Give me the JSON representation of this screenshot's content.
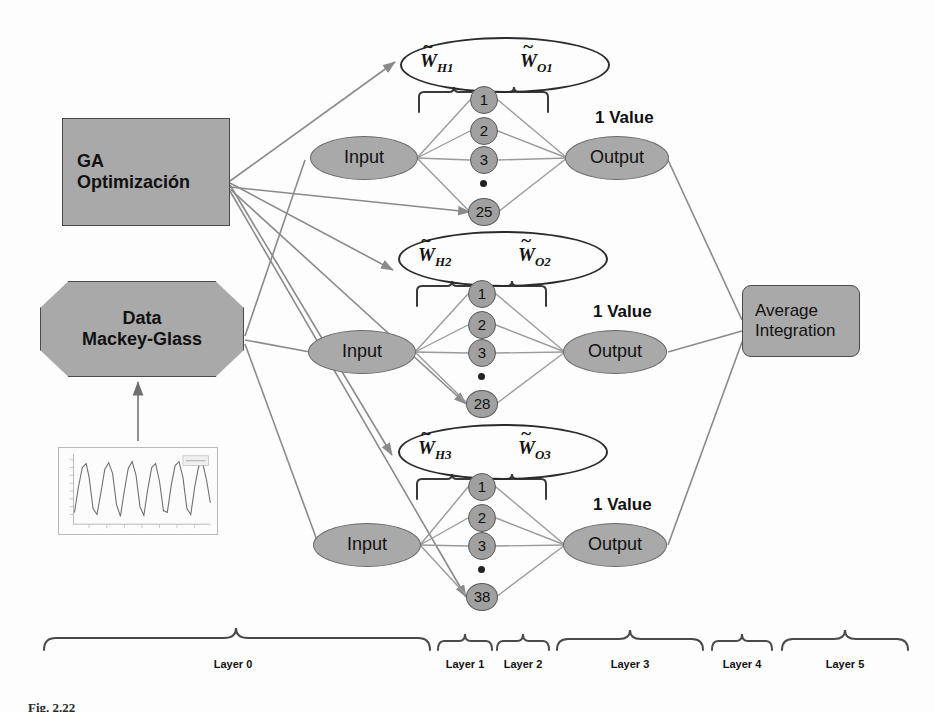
{
  "figure": {
    "caption": "Fig. 2.22"
  },
  "sources": {
    "ga": {
      "line1": "GA",
      "line2": "Optimización"
    },
    "data": {
      "line1": "Data",
      "line2": "Mackey-Glass"
    },
    "thumbnail_name": "mackey-glass-timeseries-plot"
  },
  "aggregator": {
    "line1": "Average",
    "line2": "Integration"
  },
  "modules": [
    {
      "weight_hidden": {
        "base": "W",
        "sub": "H1"
      },
      "weight_output": {
        "base": "W",
        "sub": "O1"
      },
      "input_label": "Input",
      "output_label": "Output",
      "value_label": "1 Value",
      "neurons": [
        "1",
        "2",
        "3",
        "•",
        "25"
      ]
    },
    {
      "weight_hidden": {
        "base": "W",
        "sub": "H2"
      },
      "weight_output": {
        "base": "W",
        "sub": "O2"
      },
      "input_label": "Input",
      "output_label": "Output",
      "value_label": "1 Value",
      "neurons": [
        "1",
        "2",
        "3",
        "•",
        "28"
      ]
    },
    {
      "weight_hidden": {
        "base": "W",
        "sub": "H3"
      },
      "weight_output": {
        "base": "W",
        "sub": "O3"
      },
      "input_label": "Input",
      "output_label": "Output",
      "value_label": "1 Value",
      "neurons": [
        "1",
        "2",
        "3",
        "•",
        "38"
      ]
    }
  ],
  "layers": [
    {
      "label": "Layer 0"
    },
    {
      "label": "Layer 1"
    },
    {
      "label": "Layer 2"
    },
    {
      "label": "Layer 3"
    },
    {
      "label": "Layer 4"
    },
    {
      "label": "Layer 5"
    }
  ],
  "colors": {
    "fill_gray": "#a9a9a9",
    "neuron_gray": "#a0a0a0",
    "stroke_dark": "#4a4a4a",
    "wire_gray": "#8a8a8a",
    "background": "#fdfdfd"
  }
}
